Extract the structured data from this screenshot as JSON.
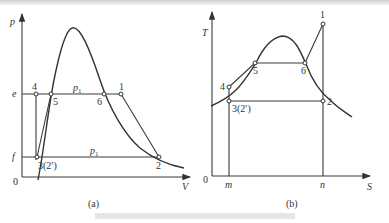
{
  "figure": {
    "panel_a": {
      "caption": "(a)",
      "x_axis": "V",
      "y_axis": "p",
      "origin": "0",
      "levels": {
        "upper": "e",
        "lower": "f"
      },
      "pressure_label_upper": "p",
      "pressure_label_upper_sub": "1",
      "pressure_label_lower": "p",
      "pressure_label_lower_sub": "1",
      "points": {
        "p1": "1",
        "p2": "2",
        "p3": "3(2′)",
        "p4": "4",
        "p5": "5",
        "p6": "6"
      }
    },
    "panel_b": {
      "caption": "(b)",
      "x_axis": "S",
      "y_axis": "T",
      "origin": "0",
      "ticks": {
        "m": "m",
        "n": "n"
      },
      "points": {
        "p1": "1",
        "p2": "2",
        "p3": "3(2′)",
        "p4": "4",
        "p5": "5",
        "p6": "6"
      }
    }
  }
}
